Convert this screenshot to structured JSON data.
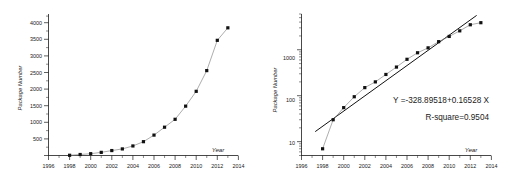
{
  "figure": {
    "background": "#ffffff",
    "marker_color": "#111111",
    "line_color": "#8a8a8a",
    "fit_color": "#111111"
  },
  "chart_data": [
    {
      "type": "line",
      "panel": "left",
      "title": "",
      "xlabel": "Year",
      "ylabel": "Package Number",
      "xlim": [
        1996,
        2014
      ],
      "ylim": [
        0,
        4300
      ],
      "xticks": [
        1996,
        1998,
        2000,
        2002,
        2004,
        2006,
        2008,
        2010,
        2012,
        2014
      ],
      "xticklabels": [
        "1996",
        "1998",
        "2000",
        "2002",
        "2004",
        "2006",
        "2008",
        "2010",
        "2012",
        "2014"
      ],
      "yticks": [
        500,
        1000,
        1500,
        2000,
        2500,
        3000,
        3500,
        4000
      ],
      "yticklabels": [
        "500",
        "1000",
        "1500",
        "2000",
        "2500",
        "3000",
        "3500",
        "4000"
      ],
      "yscale": "linear",
      "grid": false,
      "legend": "none",
      "x": [
        1998,
        1999,
        2000,
        2001,
        2002,
        2003,
        2004,
        2005,
        2006,
        2007,
        2008,
        2009,
        2010,
        2011,
        2012,
        2013
      ],
      "values": [
        7,
        30,
        55,
        95,
        150,
        200,
        290,
        420,
        620,
        860,
        1100,
        1500,
        1950,
        2580,
        3500,
        3880
      ],
      "marker": "square",
      "annotations": []
    },
    {
      "type": "scatter",
      "panel": "right",
      "title": "",
      "xlabel": "Year",
      "ylabel": "Package Number",
      "xlim": [
        1996,
        2014
      ],
      "ylim": [
        5,
        6000
      ],
      "xticks": [
        1996,
        1998,
        2000,
        2002,
        2004,
        2006,
        2008,
        2010,
        2012,
        2014
      ],
      "xticklabels": [
        "1996",
        "1998",
        "2000",
        "2002",
        "2004",
        "2006",
        "2008",
        "2010",
        "2012",
        "2014"
      ],
      "yticks": [
        10,
        100,
        1000
      ],
      "yticklabels": [
        "10",
        "100",
        "1000"
      ],
      "yscale": "log",
      "grid": false,
      "legend": "none",
      "x": [
        1998,
        1999,
        2000,
        2001,
        2002,
        2003,
        2004,
        2005,
        2006,
        2007,
        2008,
        2009,
        2010,
        2011,
        2012,
        2013
      ],
      "values": [
        7,
        30,
        55,
        95,
        150,
        200,
        290,
        420,
        620,
        860,
        1100,
        1500,
        1950,
        2580,
        3500,
        3880
      ],
      "marker": "square",
      "fit": {
        "equation": "Y =-328.89518+0.16528 X",
        "r_square": "R-square=0.9504",
        "intercept": -328.89518,
        "slope": 0.16528,
        "x_start": 1997.3,
        "x_end": 2012.6
      },
      "annotations": [
        "Y =-328.89518+0.16528 X",
        "R-square=0.9504"
      ]
    }
  ]
}
